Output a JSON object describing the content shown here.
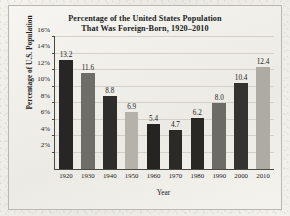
{
  "figure": {
    "title_line1": "Percentage of the United States Population",
    "title_line2": "That Was Foreign-Born, 1920–2010"
  },
  "chart_data": {
    "type": "bar",
    "title": "Percentage of the United States Population That Was Foreign-Born, 1920–2010",
    "xlabel": "Year",
    "ylabel": "Percentage of U.S. Population",
    "categories": [
      "1920",
      "1930",
      "1940",
      "1950",
      "1960",
      "1970",
      "1980",
      "1990",
      "2000",
      "2010"
    ],
    "values": [
      13.2,
      11.6,
      8.8,
      6.9,
      5.4,
      4.7,
      6.2,
      8.0,
      10.4,
      12.4
    ],
    "value_labels": [
      "13.2",
      "11.6",
      "8.8",
      "6.9",
      "5.4",
      "4.7",
      "6.2",
      "8.0",
      "10.4",
      "12.4"
    ],
    "bar_colors": [
      "#282624",
      "#6f6d68",
      "#2f2d2a",
      "#b5b2ab",
      "#262422",
      "#2c2a27",
      "#2a2825",
      "#6d6b66",
      "#35332f",
      "#aeaba4"
    ],
    "ylim": [
      0,
      16
    ],
    "yticks": [
      2,
      4,
      6,
      8,
      10,
      12,
      14,
      16
    ],
    "ytick_labels": [
      "2%",
      "4%",
      "6%",
      "8%",
      "10%",
      "12%",
      "14%",
      "16%"
    ],
    "grid": true,
    "grid_axis": "y",
    "legend": false
  }
}
